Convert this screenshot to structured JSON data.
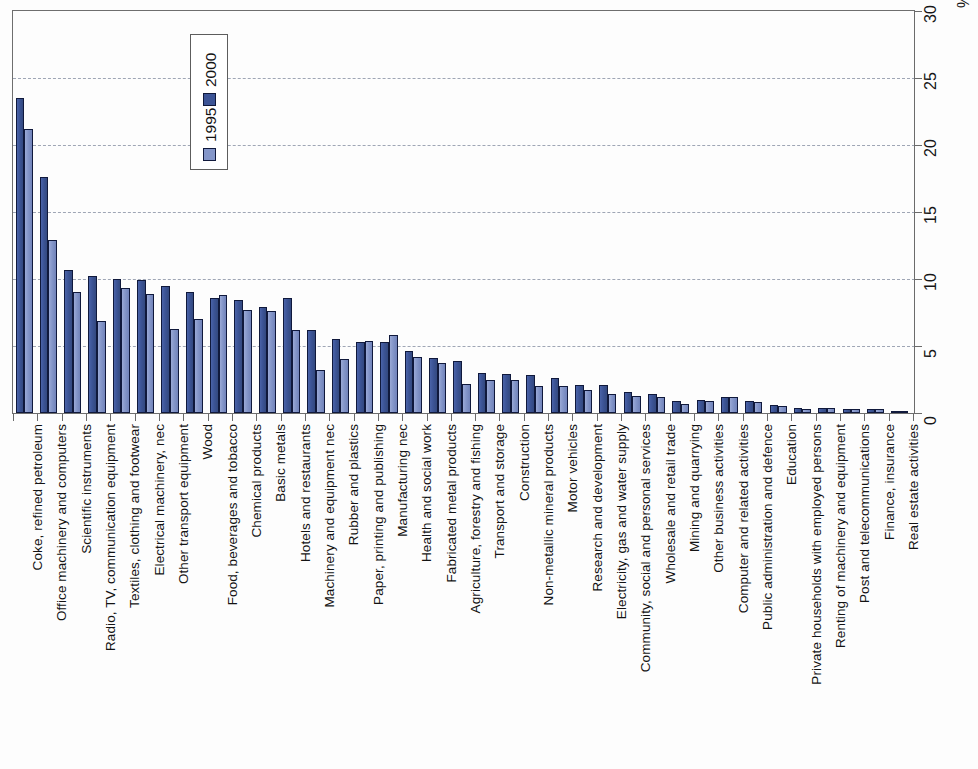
{
  "chart_data": {
    "type": "bar",
    "title": "",
    "subtitle": "",
    "orientation": "vertical-bars-rotated-90",
    "xlabel": "",
    "ylabel": "",
    "unit_label": "%",
    "ylim": [
      0,
      30
    ],
    "ytick_values": [
      0,
      5,
      10,
      15,
      20,
      25,
      30
    ],
    "ytick_labels": [
      "0",
      "5",
      "10",
      "15",
      "20",
      "25",
      "30"
    ],
    "grid": true,
    "grid_style": "dashed",
    "legend_position": "top-left-inside",
    "legend": [
      "2000",
      "1995"
    ],
    "colors": {
      "series_2000": "#3c5496",
      "series_1995": "#8496c9",
      "bar_outline": "#10193c",
      "gridline": "#9fa6b5",
      "axis": "#6b6b6b",
      "text": "#131313",
      "background": "#fdfdfd"
    },
    "categories": [
      "Coke, refined petroleum",
      "Office machinery and computers",
      "Scientific instruments",
      "Radio, TV, communication equipment",
      "Textiles, clothing and footwear",
      "Electrical machinery, nec",
      "Other transport equipment",
      "Wood",
      "Food, beverages and tobacco",
      "Chemical products",
      "Basic metals",
      "Hotels and restaurants",
      "Machinery and equipment nec",
      "Rubber and plastics",
      "Paper, printing and publishing",
      "Manufacturing nec",
      "Health and social work",
      "Fabricated metal products",
      "Agriculture, forestry and fishing",
      "Transport and storage",
      "Construction",
      "Non-metallic mineral products",
      "Motor vehicles",
      "Research and development",
      "Electricity, gas and water supply",
      "Community, social and personal services",
      "Wholesale and retail trade",
      "Mining and quarrying",
      "Other business activities",
      "Computer and related activities",
      "Public administration and defence",
      "Education",
      "Private households with employed persons",
      "Renting of machinery and equipment",
      "Post and telecommunications",
      "Finance, insurance",
      "Real estate activities"
    ],
    "series": [
      {
        "name": "2000",
        "color": "#3c5496",
        "values": [
          23.5,
          17.6,
          10.7,
          10.2,
          10.0,
          9.9,
          9.5,
          9.0,
          8.6,
          8.4,
          7.9,
          8.6,
          6.2,
          5.5,
          5.3,
          5.3,
          4.6,
          4.1,
          3.9,
          3.0,
          2.9,
          2.8,
          2.6,
          2.1,
          2.1,
          1.6,
          1.4,
          0.9,
          1.0,
          1.2,
          0.9,
          0.6,
          0.4,
          0.4,
          0.3,
          0.3,
          0.1
        ]
      },
      {
        "name": "1995",
        "color": "#8496c9",
        "values": [
          21.2,
          12.9,
          9.0,
          6.9,
          9.3,
          8.9,
          6.3,
          7.0,
          8.8,
          7.7,
          7.6,
          6.2,
          3.2,
          4.0,
          5.4,
          5.8,
          4.2,
          3.7,
          2.2,
          2.5,
          2.5,
          2.0,
          2.0,
          1.7,
          1.4,
          1.3,
          1.2,
          0.7,
          0.9,
          1.2,
          0.8,
          0.5,
          0.3,
          0.4,
          0.3,
          0.3,
          0.1
        ]
      }
    ]
  }
}
